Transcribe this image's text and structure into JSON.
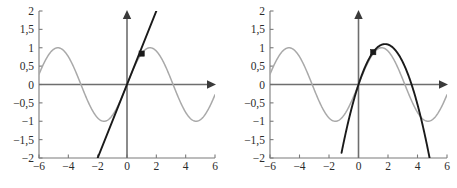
{
  "figure": {
    "background_color": "#ffffff",
    "sine_color": "#a9a9a9",
    "approx_color": "#1a1a1a",
    "axis_color": "#7a7a7a",
    "marker_color": "#1a1a1a"
  },
  "axes": {
    "x_ticks": [
      "-6",
      "-4",
      "-2",
      "0",
      "2",
      "4",
      "6"
    ],
    "x_tick_values": [
      -6,
      -4,
      -2,
      0,
      2,
      4,
      6
    ],
    "y_ticks": [
      "2",
      "1,5",
      "1",
      "0,5",
      "0",
      "-0,5",
      "-1",
      "-1,5",
      "-2"
    ],
    "y_tick_values": [
      2,
      1.5,
      1,
      0.5,
      0,
      -0.5,
      -1,
      -1.5,
      -2
    ],
    "xlim": [
      -6,
      6
    ],
    "ylim": [
      -2,
      2
    ],
    "decimal_separator": ","
  },
  "chart_data": [
    {
      "type": "line",
      "panel": "left",
      "title": "",
      "xlabel": "",
      "ylabel": "",
      "xlim": [
        -6,
        6
      ],
      "ylim": [
        -2,
        2
      ],
      "grid": false,
      "legend": "none",
      "x_ticks": [
        -6,
        -4,
        -2,
        0,
        2,
        4,
        6
      ],
      "y_ticks": [
        2,
        1.5,
        1,
        0.5,
        0,
        -0.5,
        -1,
        -1.5,
        -2
      ],
      "series": [
        {
          "name": "sin(x)",
          "color": "#a9a9a9",
          "kind": "sine",
          "amplitude": 1,
          "period": 6.2831853,
          "phase": 0,
          "x_range": [
            -6,
            6
          ],
          "x": [
            -6,
            -5.5,
            -5,
            -4.5,
            -4,
            -3.5,
            -3,
            -2.5,
            -2,
            -1.5,
            -1,
            -0.5,
            0,
            0.5,
            1,
            1.5,
            2,
            2.5,
            3,
            3.5,
            4,
            4.5,
            5,
            5.5,
            6
          ],
          "values": [
            0.279,
            0.706,
            0.959,
            0.978,
            0.757,
            0.351,
            -0.141,
            -0.599,
            -0.909,
            -0.997,
            -0.841,
            -0.479,
            0,
            0.479,
            0.841,
            0.997,
            0.909,
            0.599,
            0.141,
            -0.351,
            -0.757,
            -0.978,
            -0.959,
            -0.706,
            -0.279
          ]
        },
        {
          "name": "y = x",
          "color": "#1a1a1a",
          "kind": "line",
          "slope": 1,
          "intercept": 0,
          "x_range": [
            -2.85,
            2.15
          ],
          "x": [
            -2.85,
            2.15
          ],
          "values": [
            -2.85,
            2.15
          ]
        }
      ],
      "markers": [
        {
          "name": "tangency-point",
          "x": 1,
          "y": 0.841,
          "shape": "square",
          "color": "#1a1a1a"
        }
      ]
    },
    {
      "type": "line",
      "panel": "right",
      "title": "",
      "xlabel": "",
      "ylabel": "",
      "xlim": [
        -6,
        6
      ],
      "ylim": [
        -2,
        2
      ],
      "grid": false,
      "legend": "none",
      "x_ticks": [
        -6,
        -4,
        -2,
        0,
        2,
        4,
        6
      ],
      "y_ticks": [
        2,
        1.5,
        1,
        0.5,
        0,
        -0.5,
        -1,
        -1.5,
        -2
      ],
      "series": [
        {
          "name": "sin(x)",
          "color": "#a9a9a9",
          "kind": "sine",
          "amplitude": 1,
          "period": 6.2831853,
          "phase": 0,
          "x_range": [
            -6,
            6
          ],
          "x": [
            -6,
            -5.5,
            -5,
            -4.5,
            -4,
            -3.5,
            -3,
            -2.5,
            -2,
            -1.5,
            -1,
            -0.5,
            0,
            0.5,
            1,
            1.5,
            2,
            2.5,
            3,
            3.5,
            4,
            4.5,
            5,
            5.5,
            6
          ],
          "values": [
            0.279,
            0.706,
            0.959,
            0.978,
            0.757,
            0.351,
            -0.141,
            -0.599,
            -0.909,
            -0.997,
            -0.841,
            -0.479,
            0,
            0.479,
            0.841,
            0.997,
            0.909,
            0.599,
            0.141,
            -0.351,
            -0.757,
            -0.978,
            -0.959,
            -0.706,
            -0.279
          ]
        },
        {
          "name": "quadratic approximation",
          "color": "#1a1a1a",
          "kind": "parabola",
          "vertex_x": 1.8,
          "vertex_y": 1.1,
          "a": -0.34,
          "roots": [
            0,
            4.7
          ],
          "x_range": [
            -1.15,
            4.85
          ],
          "x": [
            -1.15,
            -0.8,
            -0.4,
            0,
            0.5,
            1,
            1.5,
            1.8,
            2.2,
            2.7,
            3.2,
            3.7,
            4.2,
            4.6,
            4.85
          ],
          "values": [
            -2.0,
            -1.29,
            -0.64,
            0,
            0.54,
            0.88,
            1.07,
            1.1,
            1.05,
            0.82,
            0.44,
            -0.1,
            -0.77,
            -1.4,
            -1.82
          ]
        }
      ],
      "markers": [
        {
          "name": "tangency-point",
          "x": 1,
          "y": 0.88,
          "shape": "square",
          "color": "#1a1a1a"
        }
      ]
    }
  ]
}
